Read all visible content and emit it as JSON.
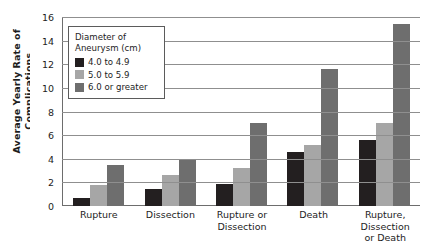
{
  "chart_data": {
    "type": "bar",
    "title": "",
    "subtitle": "",
    "xlabel": "",
    "ylabel": "Average Yearly Rate of Complications\n(percent)",
    "categories": [
      "Rupture",
      "Dissection",
      "Rupture or\nDissection",
      "Death",
      "Rupture, Dissection\nor Death"
    ],
    "series": [
      {
        "name": "4.0 to 4.9",
        "color": "#231f20",
        "values": [
          0.7,
          1.4,
          1.9,
          4.6,
          5.6
        ]
      },
      {
        "name": "5.0 to 5.9",
        "color": "#a6a6a6",
        "values": [
          1.8,
          2.6,
          3.2,
          5.2,
          7.0
        ]
      },
      {
        "name": "6.0 or greater",
        "color": "#6e6e6e",
        "values": [
          3.5,
          4.0,
          7.0,
          11.6,
          15.4
        ]
      }
    ],
    "ylim": [
      0,
      16
    ],
    "yticks": [
      0,
      2,
      4,
      6,
      8,
      10,
      12,
      14,
      16
    ],
    "ytick_labels": [
      "0",
      "2",
      "4",
      "6",
      "8",
      "10",
      "12",
      "14",
      "16"
    ],
    "grid": true,
    "legend": {
      "title": "Diameter of\nAneurysm (cm)",
      "position": "upper left",
      "entries": [
        "4.0 to 4.9",
        "5.0 to 5.9",
        "6.0 or greater"
      ]
    }
  }
}
